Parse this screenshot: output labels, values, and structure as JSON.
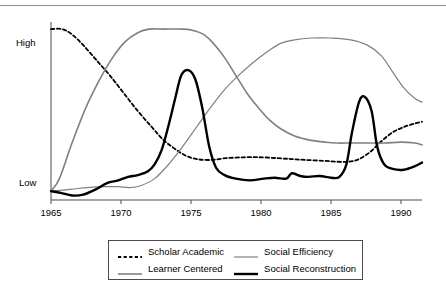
{
  "page": {
    "top_fragment": "",
    "background": "#ffffff"
  },
  "axes": {
    "y_high_label": "High",
    "y_low_label": "Low",
    "x_tick_labels": [
      "1965",
      "1970",
      "1975",
      "1980",
      "1985",
      "1990"
    ]
  },
  "legend": {
    "items": [
      {
        "label": "Scholar Academic",
        "style": "dashed",
        "color": "#000000",
        "width": 1.8
      },
      {
        "label": "Social Efficiency",
        "style": "solid",
        "color": "#808080",
        "width": 1.2
      },
      {
        "label": "Learner Centered",
        "style": "solid",
        "color": "#808080",
        "width": 1.6
      },
      {
        "label": "Social Reconstruction",
        "style": "solid",
        "color": "#000000",
        "width": 2.4
      }
    ]
  },
  "chart_data": {
    "type": "line",
    "title": "",
    "subtitle": "",
    "xlabel": "",
    "ylabel": "",
    "xlim": [
      1965,
      1991.5
    ],
    "ylim": [
      0,
      100
    ],
    "y_tick_values": [
      5,
      95
    ],
    "y_tick_labels": [
      "Low",
      "High"
    ],
    "x_tick_values": [
      1965,
      1970,
      1975,
      1980,
      1985,
      1990
    ],
    "grid": false,
    "legend_position": "bottom-center",
    "series": [
      {
        "name": "Scholar Academic",
        "color": "#000000",
        "style": "dashed",
        "width": 1.8,
        "x": [
          1965,
          1965.8,
          1966.5,
          1967.3,
          1968.2,
          1969.2,
          1970.2,
          1971.2,
          1972.2,
          1973.0,
          1973.8,
          1974.6,
          1975.4,
          1976.4,
          1977.5,
          1978.8,
          1980.0,
          1981.2,
          1982.2,
          1983.2,
          1984.5,
          1985.5,
          1986.3,
          1987.0,
          1987.8,
          1988.6,
          1989.4,
          1990.2,
          1991.0,
          1991.5
        ],
        "y": [
          96,
          96,
          93,
          87,
          79,
          70,
          60,
          50,
          41,
          34,
          29,
          25,
          23,
          22.5,
          23.5,
          24,
          24,
          23.5,
          23,
          22.5,
          22,
          21.5,
          21.5,
          23,
          27,
          33,
          38,
          41,
          43,
          44
        ]
      },
      {
        "name": "Learner Centered",
        "color": "#808080",
        "style": "solid",
        "width": 1.6,
        "x": [
          1965,
          1965.6,
          1966.5,
          1967.5,
          1968.5,
          1969.4,
          1970.3,
          1971.2,
          1972.0,
          1973.0,
          1974.5,
          1975.3,
          1975.9,
          1976.6,
          1977.4,
          1978.2,
          1979.0,
          1979.8,
          1980.6,
          1981.4,
          1982.4,
          1983.6,
          1984.6,
          1985.4,
          1986.4,
          1987.6,
          1988.8,
          1990.0,
          1991.0,
          1991.5
        ],
        "y": [
          5,
          12,
          32,
          52,
          68,
          80,
          89,
          94,
          96,
          96,
          96,
          95,
          93,
          88,
          80,
          70,
          60,
          52,
          45,
          40,
          36,
          33.5,
          32.5,
          32,
          32,
          32,
          32,
          32.5,
          32,
          31
        ]
      },
      {
        "name": "Social Efficiency",
        "color": "#808080",
        "style": "solid",
        "width": 1.2,
        "x": [
          1965,
          1966.4,
          1967.6,
          1968.8,
          1969.8,
          1970.6,
          1971.4,
          1972.4,
          1973.4,
          1974.4,
          1975.4,
          1976.4,
          1977.4,
          1978.4,
          1979.4,
          1980.4,
          1981.4,
          1982.4,
          1983.6,
          1985.0,
          1986.4,
          1987.6,
          1988.6,
          1989.4,
          1990.2,
          1991.0,
          1991.5
        ],
        "y": [
          5,
          6,
          7,
          7.5,
          7.5,
          7,
          8,
          12,
          20,
          30,
          41,
          52,
          62,
          70,
          77,
          83,
          88,
          90,
          91,
          91,
          90,
          87,
          81,
          72,
          63,
          57,
          55
        ]
      },
      {
        "name": "Social Reconstruction",
        "color": "#000000",
        "style": "solid",
        "width": 2.4,
        "x": [
          1965,
          1965.7,
          1966.5,
          1967.3,
          1968.2,
          1969.0,
          1969.8,
          1970.5,
          1971.2,
          1971.9,
          1972.4,
          1972.9,
          1973.4,
          1973.9,
          1974.3,
          1974.8,
          1975.3,
          1975.8,
          1976.3,
          1976.8,
          1977.4,
          1978.2,
          1979.2,
          1980.2,
          1981.0,
          1981.8,
          1982.2,
          1982.8,
          1983.4,
          1984.2,
          1985.0,
          1985.6,
          1986.1,
          1986.5,
          1987.0,
          1987.4,
          1987.9,
          1988.3,
          1988.8,
          1989.4,
          1990.2,
          1991.0,
          1991.5
        ],
        "y": [
          5,
          4,
          2.5,
          3,
          6,
          9.5,
          11,
          13,
          14,
          16,
          20,
          28,
          42,
          58,
          70,
          73,
          68,
          52,
          30,
          18,
          14,
          12,
          11,
          12,
          12.5,
          12,
          15,
          13.5,
          13,
          13.5,
          12.5,
          13,
          20,
          38,
          55,
          58,
          50,
          30,
          20,
          17.5,
          17,
          19,
          21
        ]
      }
    ]
  }
}
